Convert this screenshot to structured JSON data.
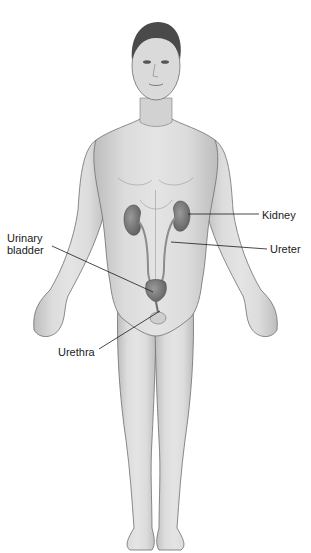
{
  "diagram": {
    "labels": {
      "kidney": "Kidney",
      "ureter": "Ureter",
      "urinary_bladder_line1": "Urinary",
      "urinary_bladder_line2": "bladder",
      "urethra": "Urethra"
    },
    "colors": {
      "skin": "#d9d9d9",
      "skin_shadow": "#b8b8b8",
      "outline": "#6e6e6e",
      "organ": "#6f6f6f",
      "organ_highlight": "#8c8c8c",
      "hair": "#4a4a4a",
      "leader_line": "#1a1a1a",
      "background": "#ffffff"
    }
  }
}
